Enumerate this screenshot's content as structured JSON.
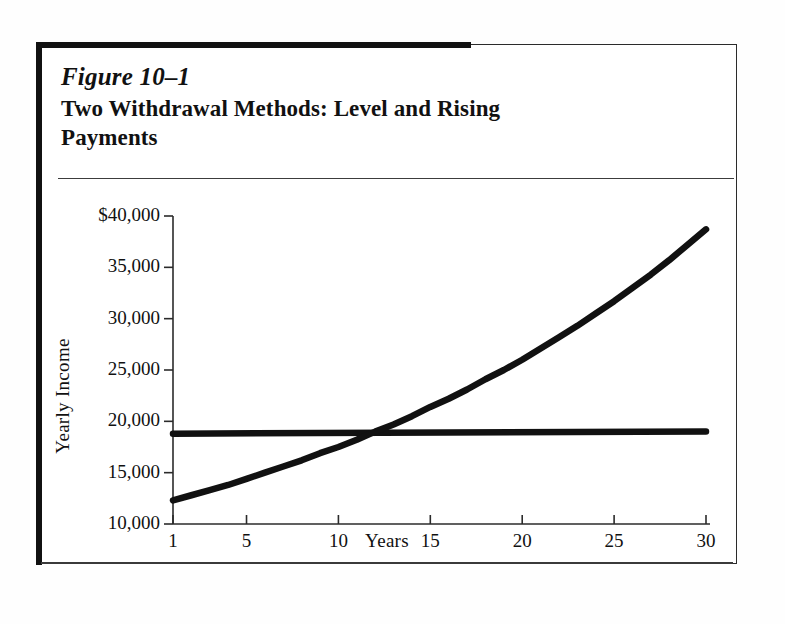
{
  "figure": {
    "number": "Figure 10–1",
    "title": "Two Withdrawal Methods:  Level and Rising Payments"
  },
  "chart_data": {
    "type": "line",
    "title": "Two Withdrawal Methods:  Level and Rising Payments",
    "xlabel": "Years",
    "ylabel": "Yearly Income",
    "xlim": [
      1,
      30
    ],
    "ylim": [
      10000,
      40000
    ],
    "xticks": [
      1,
      5,
      10,
      15,
      20,
      25,
      30
    ],
    "xtick_labels": [
      "1",
      "5",
      "10",
      "15",
      "20",
      "25",
      "30"
    ],
    "yticks": [
      10000,
      15000,
      20000,
      25000,
      30000,
      35000,
      40000
    ],
    "ytick_labels": [
      "10,000",
      "15,000",
      "20,000",
      "25,000",
      "30,000",
      "35,000",
      "$40,000"
    ],
    "grid": false,
    "legend": "none",
    "line_color": "#111111",
    "series": [
      {
        "name": "Level Payments",
        "x": [
          1,
          30
        ],
        "values": [
          18800,
          19000
        ]
      },
      {
        "name": "Rising Payments",
        "x": [
          1,
          2,
          3,
          4,
          5,
          6,
          7,
          8,
          9,
          10,
          11,
          12,
          13,
          14,
          15,
          16,
          17,
          18,
          19,
          20,
          21,
          22,
          23,
          24,
          25,
          26,
          27,
          28,
          29,
          30
        ],
        "values": [
          12300,
          12800,
          13300,
          13800,
          14400,
          15000,
          15600,
          16200,
          16900,
          17500,
          18200,
          19000,
          19700,
          20500,
          21400,
          22200,
          23100,
          24100,
          25000,
          26000,
          27100,
          28200,
          29300,
          30500,
          31700,
          33000,
          34300,
          35700,
          37200,
          38700
        ]
      }
    ],
    "annotations": {
      "crossover_year": 12.5,
      "crossover_value": 18900
    }
  }
}
